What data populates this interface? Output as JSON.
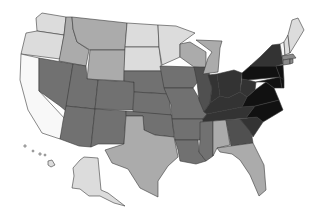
{
  "map": {
    "type": "choropleth",
    "region": "United States",
    "colors": {
      "c1": "#dcdcdc",
      "c2": "#ababab",
      "c3": "#8a8a8a",
      "c4": "#717171",
      "c5": "#505050",
      "c6": "#333333",
      "c7": "#111111",
      "white": "#f8f8f8",
      "border": "#3a3a3a"
    },
    "states": [
      {
        "id": "WA",
        "shade": "c1",
        "points": "42,13 66,17 64,35 37,31 36,18"
      },
      {
        "id": "OR",
        "shade": "c1",
        "points": "26,33 37,31 64,35 60,59 21,54"
      },
      {
        "id": "CA",
        "shade": "white",
        "points": "21,54 39,58 39,91 66,120 60,139 42,133 28,110 20,80"
      },
      {
        "id": "ID",
        "shade": "c2",
        "points": "66,17 72,17 73,29 77,42 89,50 86,66 59,61 64,35"
      },
      {
        "id": "NV",
        "shade": "c4",
        "points": "39,58 73,64 66,111 60,106 39,91"
      },
      {
        "id": "MT",
        "shade": "c2",
        "points": "72,17 127,23 125,50 90,50 77,42 73,29"
      },
      {
        "id": "WY",
        "shade": "c2",
        "points": "90,50 125,50 124,81 87,79"
      },
      {
        "id": "UT",
        "shade": "c4",
        "points": "73,64 86,66 87,79 98,80 95,109 66,106"
      },
      {
        "id": "AZ",
        "shade": "c4",
        "points": "66,106 95,109 91,147 79,146 60,139 63,121"
      },
      {
        "id": "CO",
        "shade": "c4",
        "points": "98,80 134,82 133,110 95,109"
      },
      {
        "id": "NM",
        "shade": "c4",
        "points": "95,109 126,111 124,144 98,144 91,147"
      },
      {
        "id": "ND",
        "shade": "c1",
        "points": "127,23 158,25 159,47 125,47"
      },
      {
        "id": "SD",
        "shade": "c1",
        "points": "125,47 159,47 162,71 124,71"
      },
      {
        "id": "NE",
        "shade": "c4",
        "points": "124,71 162,71 169,94 134,92 134,82 124,81"
      },
      {
        "id": "KS",
        "shade": "c4",
        "points": "134,92 169,94 171,115 133,113"
      },
      {
        "id": "OK",
        "shade": "c4",
        "points": "126,111 172,115 174,137 155,135 144,130 143,116 126,116"
      },
      {
        "id": "TX",
        "shade": "c2",
        "points": "126,116 143,116 144,130 155,135 174,137 178,157 168,166 158,181 158,197 140,188 128,169 112,163 105,150 124,144"
      },
      {
        "id": "MN",
        "shade": "c1",
        "points": "158,25 176,26 195,33 180,44 180,57 162,65 159,47"
      },
      {
        "id": "IA",
        "shade": "c4",
        "points": "160,66 194,67 199,80 193,88 164,88"
      },
      {
        "id": "MO",
        "shade": "c4",
        "points": "164,88 193,88 200,100 207,114 203,119 172,119 171,105"
      },
      {
        "id": "AR",
        "shade": "c4",
        "points": "172,119 203,119 200,140 175,140"
      },
      {
        "id": "LA",
        "shade": "c4",
        "points": "175,140 198,140 199,152 206,161 196,164 180,161 178,150"
      },
      {
        "id": "WI",
        "shade": "c2",
        "points": "180,44 190,42 206,52 206,68 194,67 180,57"
      },
      {
        "id": "IL",
        "shade": "c5",
        "points": "194,67 208,67 212,88 210,103 204,112 199,100 197,82"
      },
      {
        "id": "MI",
        "shade": "c2",
        "points": "196,40 222,41 220,48 218,72 203,74 208,58 212,52"
      },
      {
        "id": "IN",
        "shade": "c6",
        "points": "208,75 217,74 220,96 210,103 212,88"
      },
      {
        "id": "OH",
        "shade": "c6",
        "points": "217,74 234,70 242,73 240,92 228,98 220,96"
      },
      {
        "id": "KY",
        "shade": "c6",
        "points": "204,112 210,103 220,96 228,98 240,92 247,97 242,107 207,114"
      },
      {
        "id": "TN",
        "shade": "c6",
        "points": "203,119 207,114 242,107 255,106 246,118 203,122"
      },
      {
        "id": "MS",
        "shade": "c4",
        "points": "200,122 213,121 213,156 206,161 199,152 200,140"
      },
      {
        "id": "AL",
        "shade": "c2",
        "points": "213,121 226,120 230,145 217,148 213,156"
      },
      {
        "id": "GA",
        "shade": "c5",
        "points": "226,120 240,119 251,131 253,143 231,146"
      },
      {
        "id": "FL",
        "shade": "c2",
        "points": "217,148 231,146 253,143 264,165 266,190 259,196 250,175 240,160 232,154 220,152"
      },
      {
        "id": "SC",
        "shade": "c6",
        "points": "240,119 257,117 263,122 253,137 250,131"
      },
      {
        "id": "NC",
        "shade": "c7",
        "points": "246,118 255,106 279,100 283,110 263,122 257,117"
      },
      {
        "id": "VA",
        "shade": "c7",
        "points": "242,107 247,97 255,90 266,82 274,88 279,100 255,106"
      },
      {
        "id": "WV",
        "shade": "c6",
        "points": "240,92 242,79 248,80 256,82 255,90 247,97"
      },
      {
        "id": "PA",
        "shade": "c7",
        "points": "242,73 250,66 276,66 280,77 248,80 242,79"
      },
      {
        "id": "NY",
        "shade": "c6",
        "points": "250,66 260,57 272,45 280,44 283,64 276,66"
      },
      {
        "id": "NJ",
        "shade": "c7",
        "points": "276,66 283,65 284,80 280,82 280,77"
      },
      {
        "id": "MD",
        "shade": "c7",
        "points": "256,82 280,77 282,88 274,88 266,82"
      },
      {
        "id": "DE",
        "shade": "c7",
        "points": "280,77 284,80 284,88 282,88"
      },
      {
        "id": "VT",
        "shade": "white",
        "points": "280,44 284,42 285,55 282,56"
      },
      {
        "id": "NH",
        "shade": "c1",
        "points": "284,42 288,35 290,53 285,55"
      },
      {
        "id": "ME",
        "shade": "c1",
        "points": "288,35 292,20 298,18 304,30 298,40 290,53"
      },
      {
        "id": "MA",
        "shade": "c3",
        "points": "282,56 293,54 296,58 283,60"
      },
      {
        "id": "CT",
        "shade": "c3",
        "points": "283,60 290,59 290,64 283,65"
      },
      {
        "id": "RI",
        "shade": "c3",
        "points": "290,59 293,59 293,63 290,64"
      },
      {
        "id": "AK",
        "shade": "c1",
        "points": "80,160 84,157 98,158 101,190 108,193 125,206 114,203 100,196 89,196 80,189 72,188 74,176 73,168"
      },
      {
        "id": "HI",
        "shade": "c1",
        "points": "48,161 52,160 55,165 51,167 48,165"
      }
    ],
    "hawaii_islets": [
      {
        "cx": 25,
        "cy": 146,
        "r": 1.2
      },
      {
        "cx": 33,
        "cy": 151,
        "r": 1.0
      },
      {
        "cx": 40,
        "cy": 154,
        "r": 1.2
      },
      {
        "cx": 45,
        "cy": 155,
        "r": 1.0
      }
    ]
  }
}
